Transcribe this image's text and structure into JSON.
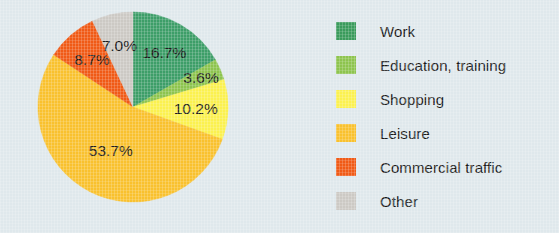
{
  "chart_data": {
    "type": "pie",
    "title": "",
    "subtitle": "",
    "xlabel": "",
    "ylabel": "",
    "units": "percent",
    "legend_position": "right",
    "grid": false,
    "start_angle_deg": 0,
    "direction": "clockwise",
    "categories": [
      "Work",
      "Education, training",
      "Shopping",
      "Leisure",
      "Commercial traffic",
      "Other"
    ],
    "values": [
      16.7,
      3.6,
      10.2,
      53.7,
      8.7,
      7.0
    ],
    "data_labels": [
      "16.7%",
      "3.6%",
      "10.2%",
      "53.7%",
      "8.7%",
      "7.0%"
    ],
    "colors": [
      "#3d9e68",
      "#8dc44e",
      "#fbf14f",
      "#f9c12e",
      "#f05a16",
      "#ccc9c4"
    ],
    "slices": [
      {
        "label": "Work",
        "value": 16.7,
        "data_label": "16.7%",
        "color": "#3d9e68",
        "legend_color": "#3a9b5c"
      },
      {
        "label": "Education, training",
        "value": 3.6,
        "data_label": "3.6%",
        "color": "#8dc44e",
        "legend_color": "#8dc44e"
      },
      {
        "label": "Shopping",
        "value": 10.2,
        "data_label": "10.2%",
        "color": "#fbf14f",
        "legend_color": "#fbf14f"
      },
      {
        "label": "Leisure",
        "value": 53.7,
        "data_label": "53.7%",
        "color": "#f9c12e",
        "legend_color": "#f9c12e"
      },
      {
        "label": "Commercial traffic",
        "value": 8.7,
        "data_label": "8.7%",
        "color": "#f05a16",
        "legend_color": "#f05a16"
      },
      {
        "label": "Other",
        "value": 7.0,
        "data_label": "7.0%",
        "color": "#ccc9c4",
        "legend_color": "#ccc9c4"
      }
    ]
  },
  "legend": {
    "items": [
      {
        "label": "Work"
      },
      {
        "label": "Education, training"
      },
      {
        "label": "Shopping"
      },
      {
        "label": "Leisure"
      },
      {
        "label": "Commercial traffic"
      },
      {
        "label": "Other"
      }
    ]
  },
  "style": {
    "background": "#dfe8ec",
    "text_color": "#1b1b1b",
    "pie_center_x": 133,
    "pie_center_y": 107,
    "pie_radius": 95,
    "label_radius_ratio": 0.66
  }
}
